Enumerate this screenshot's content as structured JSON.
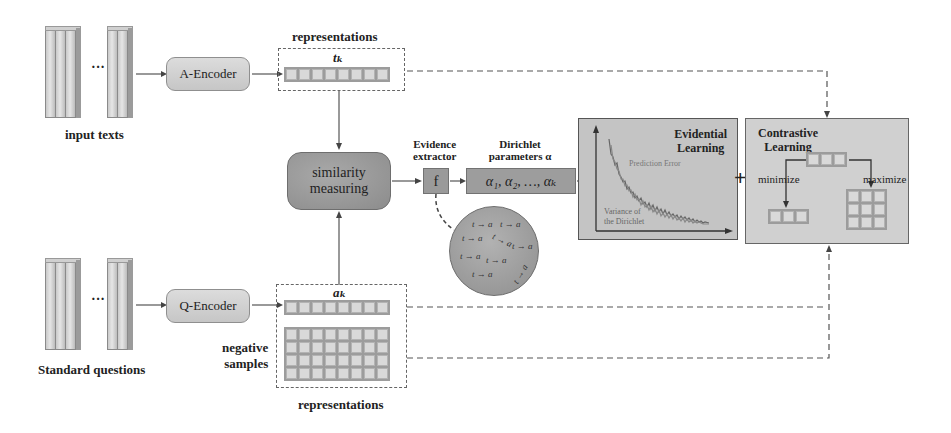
{
  "inputs": {
    "top_label": "input texts",
    "bottom_label": "Standard questions",
    "ellipsis": "···"
  },
  "encoders": {
    "a_encoder": "A-Encoder",
    "q_encoder": "Q-Encoder"
  },
  "representations": {
    "top_title": "representations",
    "top_symbol": "tₖ",
    "bottom_title": "representations",
    "bottom_symbol": "aₖ",
    "negative_label_line1": "negative",
    "negative_label_line2": "samples",
    "top_cells": 8,
    "bottom_row_cells": 8,
    "negative_rows": 4,
    "negative_cols": 8
  },
  "similarity": {
    "line1": "similarity",
    "line2": "measuring"
  },
  "evidence": {
    "title_line1": "Evidence",
    "title_line2": "extractor",
    "function_symbol": "f"
  },
  "dirichlet": {
    "title_line1": "Dirichlet",
    "title_line2": "parameters α",
    "params": "α₁, α₂, …, αₖ"
  },
  "pairs": {
    "label": "t → a",
    "count": 10
  },
  "evidential_learning": {
    "title_line1": "Evidential",
    "title_line2": "Learning",
    "curve_label_top": "Prediction Error",
    "curve_label_bottom_line1": "Variance of",
    "curve_label_bottom_line2": "the Dirichlet"
  },
  "plus_sign": "+",
  "contrastive_learning": {
    "title_line1": "Contrastive",
    "title_line2": "Learning",
    "minimize": "minimize",
    "maximize": "maximize"
  },
  "colors": {
    "box_gray": "#9d9d9d",
    "panel_gray": "#c4c4c4",
    "cell_fill": "#d9d9d9",
    "line": "#555555"
  }
}
